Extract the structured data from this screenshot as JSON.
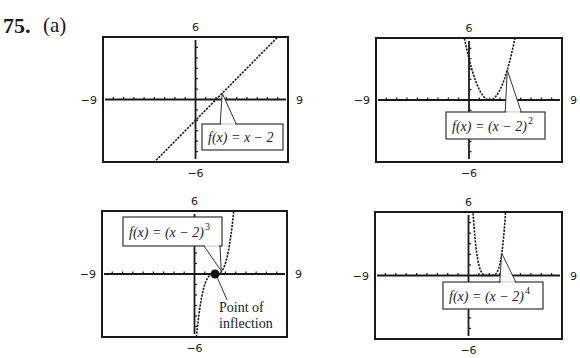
{
  "header": {
    "problem_number": "75.",
    "part": "(a)"
  },
  "chart_data": [
    {
      "type": "line",
      "id": "graph-linear",
      "function": "f(x) = x − 2",
      "label_main": "f(x) = x − 2",
      "label_exp": "",
      "power": 1,
      "window": {
        "xmin": -9,
        "xmax": 9,
        "ymin": -6,
        "ymax": 6
      },
      "tick_labels": {
        "top": "6",
        "bottom": "−6",
        "left": "−9",
        "right": "9"
      },
      "grid": false,
      "frame_px": {
        "x0": 103,
        "y0": 37,
        "x1": 288,
        "y1": 162
      },
      "label_box_px": {
        "x": 202,
        "y": 124,
        "w": 81,
        "h": 26
      },
      "pointer_to": {
        "x": 2.6,
        "y": 0.6
      }
    },
    {
      "type": "line",
      "id": "graph-square",
      "function": "f(x) = (x − 2)^2",
      "label_main": "f(x) = (x − 2)",
      "label_exp": "2",
      "power": 2,
      "window": {
        "xmin": -9,
        "xmax": 9,
        "ymin": -6,
        "ymax": 6
      },
      "tick_labels": {
        "top": "6",
        "bottom": "−6",
        "left": "−9",
        "right": "9"
      },
      "grid": false,
      "frame_px": {
        "x0": 376,
        "y0": 38,
        "x1": 562,
        "y1": 162
      },
      "label_box_px": {
        "x": 446,
        "y": 112,
        "w": 99,
        "h": 27
      },
      "pointer_to": {
        "x": 3.7,
        "y": 2.9
      }
    },
    {
      "type": "line",
      "id": "graph-cube",
      "function": "f(x) = (x − 2)^3",
      "label_main": "f(x) = (x − 2)",
      "label_exp": "3",
      "power": 3,
      "window": {
        "xmin": -9,
        "xmax": 9,
        "ymin": -6,
        "ymax": 6
      },
      "tick_labels": {
        "top": "6",
        "bottom": "−6",
        "left": "−9",
        "right": "9"
      },
      "grid": false,
      "frame_px": {
        "x0": 102,
        "y0": 211,
        "x1": 287,
        "y1": 337
      },
      "label_box_px": {
        "x": 123,
        "y": 217,
        "w": 99,
        "h": 29
      },
      "pointer_to": {
        "x": 2.6,
        "y": 0.3
      },
      "annotation": {
        "text_line1": "Point of",
        "text_line2": "inflection",
        "point": {
          "x": 2,
          "y": 0
        }
      }
    },
    {
      "type": "line",
      "id": "graph-fourth",
      "function": "f(x) = (x − 2)^4",
      "label_main": "f(x) = (x − 2)",
      "label_exp": "4",
      "power": 4,
      "window": {
        "xmin": -9,
        "xmax": 9,
        "ymin": -6,
        "ymax": 6
      },
      "tick_labels": {
        "top": "6",
        "bottom": "−6",
        "left": "−9",
        "right": "9"
      },
      "grid": false,
      "frame_px": {
        "x0": 375,
        "y0": 212,
        "x1": 562,
        "y1": 339
      },
      "label_box_px": {
        "x": 443,
        "y": 282,
        "w": 100,
        "h": 27
      },
      "pointer_to": {
        "x": 3.2,
        "y": 2.1
      }
    }
  ]
}
